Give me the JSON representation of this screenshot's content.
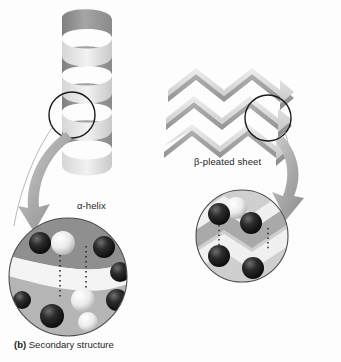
{
  "figure": {
    "caption_tag": "(b)",
    "caption_text": "Secondary structure",
    "background_color": "#fdfdfd",
    "ink_color": "#231f20"
  },
  "labels": {
    "alpha_helix": "α-helix",
    "beta_pleated_sheet": "β-pleated sheet"
  },
  "structures": {
    "alpha_helix": {
      "name": "alpha-helix-ribbon",
      "turns": 4,
      "ribbon_light": "#e8e8e8",
      "ribbon_mid": "#b9b9b9",
      "ribbon_dark": "#8d8d8d"
    },
    "beta_sheet": {
      "name": "beta-pleated-sheet-ribbon",
      "strands": 3,
      "arrow_direction": "right",
      "ribbon_light": "#efefef",
      "ribbon_mid": "#c2c2c2",
      "ribbon_dark": "#949494"
    }
  },
  "callouts": {
    "helix_circle": {
      "cx": 72,
      "cy": 115,
      "r": 23,
      "stroke": "#1a1a1a"
    },
    "sheet_circle": {
      "cx": 268,
      "cy": 118,
      "r": 23,
      "stroke": "#1a1a1a"
    },
    "helix_inset": {
      "cx": 68,
      "cy": 277,
      "r": 59
    },
    "sheet_inset": {
      "cx": 242,
      "cy": 236,
      "r": 46
    }
  },
  "insets": {
    "helix_detail": {
      "name": "alpha-helix-atomic-detail",
      "atom_dark": "#1c1c1c",
      "atom_light": "#f2f2f2",
      "hydrogen_bond_style": "dotted",
      "hydrogen_bonds": 2
    },
    "sheet_detail": {
      "name": "beta-sheet-atomic-detail",
      "atom_dark": "#1c1c1c",
      "atom_light": "#f5f5f5",
      "hydrogen_bond_style": "dotted",
      "hydrogen_bonds": 2
    }
  },
  "arrows": {
    "helix_arrow": {
      "name": "helix-zoom-arrow",
      "fill": "#a8a8a8"
    },
    "sheet_arrow": {
      "name": "sheet-zoom-arrow",
      "fill": "#a8a8a8"
    }
  }
}
